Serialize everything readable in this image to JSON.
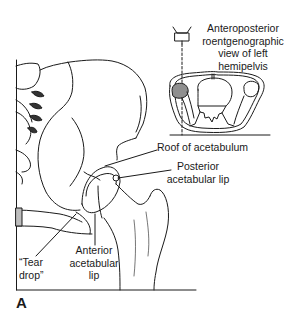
{
  "figure": {
    "panel_label": "A",
    "inset": {
      "caption_lines": [
        "Anteroposterior",
        "roentgenographic",
        "view of left",
        "hemipelvis"
      ]
    },
    "labels": {
      "roof": "Roof of acetabulum",
      "posterior_lines": [
        "Posterior",
        "acetabular lip"
      ],
      "anterior_lines": [
        "Anterior",
        "acetabular",
        "lip"
      ],
      "teardrop_lines": [
        "“Tear",
        "drop”"
      ]
    },
    "colors": {
      "line": "#1a1a1a",
      "shade": "#9a9a9a",
      "background": "#ffffff"
    }
  }
}
